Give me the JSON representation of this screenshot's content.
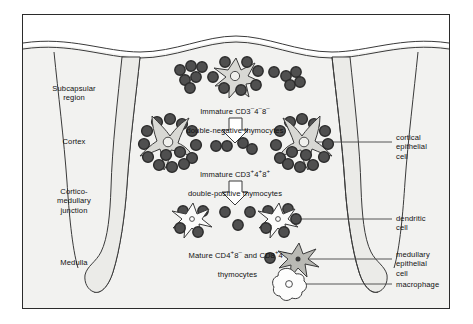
{
  "figure": {
    "type": "anatomical-schematic"
  },
  "colors": {
    "border": "#2b2b2b",
    "stroke": "#3a3a3a",
    "background": "#ffffff",
    "tissue_fill": "#f2f2f0",
    "septum_fill": "#ebebe8",
    "thymocyte_fill": "#4f4f4f",
    "thymocyte_ring": "#2e2e2e",
    "epithelial_fill": "#d8d8d4",
    "dendritic_fill": "#fbfbfa",
    "macrophage_fill": "#fdfdfc",
    "leader_line": "#444444"
  },
  "region_labels": [
    {
      "name": "subcapsular",
      "text": "Subcapsular\nregion"
    },
    {
      "name": "cortex",
      "text": "Cortex"
    },
    {
      "name": "cortico-medullary-junction",
      "text": "Cortico-\nmedullary\njunction"
    },
    {
      "name": "medulla",
      "text": "Medulla"
    }
  ],
  "stage_captions": [
    {
      "name": "double-negative",
      "line1_prefix": "Immature  CD3",
      "line1_sup1": "–",
      "line1_mid1": "4",
      "line1_sup2": "–",
      "line1_mid2": "8",
      "line1_sup3": "–",
      "line2": "double-negative  thymocytes"
    },
    {
      "name": "double-positive",
      "line1_prefix": "Immature  CD3",
      "line1_sup1": "+",
      "line1_mid1": "4",
      "line1_sup2": "+",
      "line1_mid2": "8",
      "line1_sup3": "+",
      "line2": "double-positive  thymocytes"
    },
    {
      "name": "mature-single-positive",
      "line1_prefix": "Mature  CD4",
      "line1_sup1": "+",
      "line1_mid1": "8",
      "line1_sup2": "–",
      "line1_mid2": "  and  CD8",
      "line1_sup3": "+",
      "line1_mid3": "4",
      "line1_sup4": "–",
      "line2": "thymocytes"
    }
  ],
  "callouts": [
    {
      "name": "cortical-epithelial-cell",
      "text": "cortical\nepithelial\ncell"
    },
    {
      "name": "dendritic-cell",
      "text": "dendritic\ncell"
    },
    {
      "name": "medullary-epithelial-cell",
      "text": "medullary\nepithelial\ncell"
    },
    {
      "name": "macrophage",
      "text": "macrophage"
    }
  ],
  "arrows": [
    {
      "name": "maturation-arrow-1",
      "direction": "down"
    },
    {
      "name": "maturation-arrow-2",
      "direction": "down"
    }
  ]
}
